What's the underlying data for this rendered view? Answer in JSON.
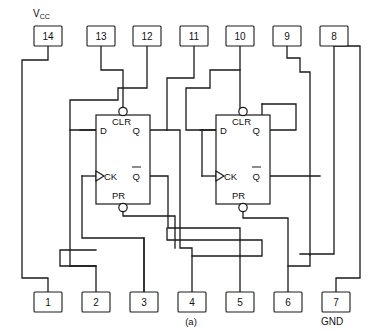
{
  "figure": {
    "caption": "(a)",
    "device_type": "dual-d-flip-flop-ic-pinout",
    "package_pins": 14
  },
  "rails": {
    "vcc_label": "V",
    "vcc_subscript": "CC",
    "gnd_label": "GND"
  },
  "pins_top": [
    {
      "number": "14",
      "x": 48,
      "rail": "VCC"
    },
    {
      "number": "13",
      "x": 101,
      "rail": ""
    },
    {
      "number": "12",
      "x": 147,
      "rail": ""
    },
    {
      "number": "11",
      "x": 194,
      "rail": ""
    },
    {
      "number": "10",
      "x": 240,
      "rail": ""
    },
    {
      "number": "9",
      "x": 287,
      "rail": ""
    },
    {
      "number": "8",
      "x": 334,
      "rail": ""
    }
  ],
  "pins_bottom": [
    {
      "number": "1",
      "x": 48,
      "rail": ""
    },
    {
      "number": "2",
      "x": 96,
      "rail": ""
    },
    {
      "number": "3",
      "x": 144,
      "rail": ""
    },
    {
      "number": "4",
      "x": 192,
      "rail": ""
    },
    {
      "number": "5",
      "x": 240,
      "rail": ""
    },
    {
      "number": "6",
      "x": 288,
      "rail": ""
    },
    {
      "number": "7",
      "x": 336,
      "rail": "GND"
    }
  ],
  "flipflops": [
    {
      "id": "ff-left",
      "labels": {
        "d": "D",
        "clr": "CLR",
        "q": "Q",
        "ck": "CK",
        "pr": "PR",
        "qbar": "Q"
      }
    },
    {
      "id": "ff-right",
      "labels": {
        "d": "D",
        "clr": "CLR",
        "q": "Q",
        "ck": "CK",
        "pr": "PR",
        "qbar": "Q"
      }
    }
  ],
  "colors": {
    "ink": "#1a1a1a",
    "background": "#ffffff"
  }
}
